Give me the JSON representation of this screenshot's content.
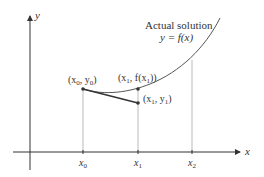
{
  "diagram": {
    "type": "euler-method-illustration",
    "axes": {
      "x_label": "x",
      "y_label": "y"
    },
    "curve": {
      "title": "Actual solution",
      "equation": "y = f(x)"
    },
    "points": [
      {
        "id": "p0",
        "label": "(x0, y0)",
        "display": [
          "(x",
          "0",
          ", y",
          "0",
          ")"
        ]
      },
      {
        "id": "p1_true",
        "label": "(x1, f(x1))",
        "display": [
          "(x",
          "1",
          ", f(x",
          "1",
          "))"
        ]
      },
      {
        "id": "p1_approx",
        "label": "(x1, y1)",
        "display": [
          "(x",
          "1",
          ", y",
          "1",
          ")"
        ]
      }
    ],
    "x_ticks": [
      {
        "label": "x",
        "sub": "0"
      },
      {
        "label": "x",
        "sub": "1"
      },
      {
        "label": "x",
        "sub": "2"
      }
    ],
    "colors": {
      "axis": "#333333",
      "curve": "#555555",
      "guide": "#aaaaaa",
      "tangent": "#333333"
    }
  }
}
